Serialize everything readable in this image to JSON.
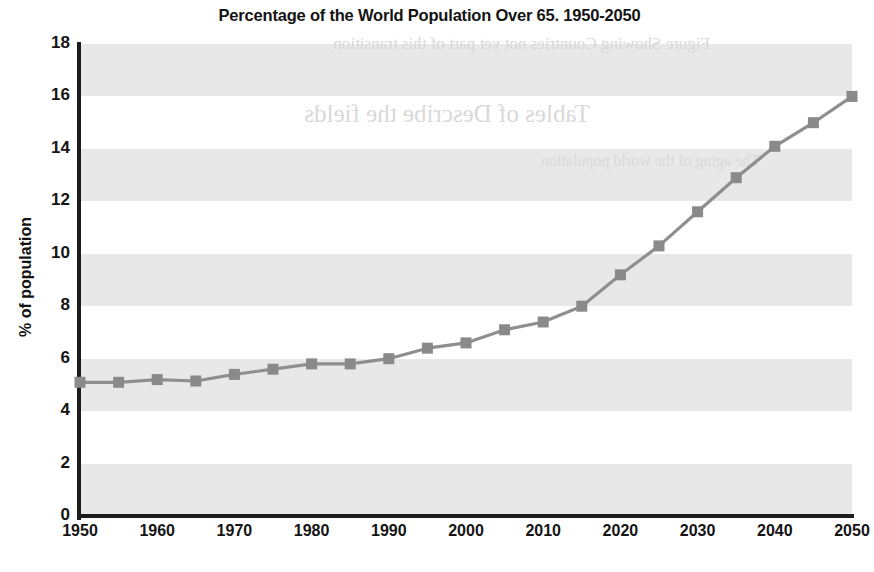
{
  "chart_data": {
    "type": "line",
    "title": "Percentage of the World Population Over 65. 1950-2050",
    "xlabel": "",
    "ylabel": "% of population",
    "xlim": [
      1950,
      2050
    ],
    "ylim": [
      0,
      18
    ],
    "ytick_step": 2,
    "xtick_step": 10,
    "grid": "horizontal-alternating-bands",
    "legend": "none",
    "marker": "square",
    "x": [
      1950,
      1955,
      1960,
      1965,
      1970,
      1975,
      1980,
      1985,
      1990,
      1995,
      2000,
      2005,
      2010,
      2015,
      2020,
      2025,
      2030,
      2035,
      2040,
      2045,
      2050
    ],
    "values": [
      5.1,
      5.1,
      5.2,
      5.15,
      5.4,
      5.6,
      5.8,
      5.8,
      6.0,
      6.4,
      6.6,
      7.1,
      7.4,
      8.0,
      9.2,
      10.3,
      11.6,
      12.9,
      14.1,
      15.0,
      16.0
    ],
    "series": [
      {
        "name": "% of world population over 65",
        "values": [
          5.1,
          5.1,
          5.2,
          5.15,
          5.4,
          5.6,
          5.8,
          5.8,
          6.0,
          6.4,
          6.6,
          7.1,
          7.4,
          8.0,
          9.2,
          10.3,
          11.6,
          12.9,
          14.1,
          15.0,
          16.0
        ]
      }
    ],
    "ytick_labels": [
      "0",
      "2",
      "4",
      "6",
      "8",
      "10",
      "12",
      "14",
      "16",
      "18"
    ],
    "ytick_values": [
      0,
      2,
      4,
      6,
      8,
      10,
      12,
      14,
      16,
      18
    ],
    "xtick_labels": [
      "1950",
      "1960",
      "1970",
      "1980",
      "1990",
      "2000",
      "2010",
      "2020",
      "2030",
      "2040",
      "2050"
    ],
    "xtick_values": [
      1950,
      1960,
      1970,
      1980,
      1990,
      2000,
      2010,
      2020,
      2030,
      2040,
      2050
    ],
    "band_ranges": [
      [
        0,
        2
      ],
      [
        4,
        6
      ],
      [
        8,
        10
      ],
      [
        12,
        14
      ],
      [
        16,
        18
      ]
    ],
    "colors": {
      "line": "#8f8f8f",
      "marker": "#8a8a8a",
      "axis": "#1c1c1c",
      "band": "#e8e8e8",
      "text": "#141414",
      "background": "#ffffff"
    }
  },
  "artifacts": {
    "note": "faint mirrored bleed-through text from reverse page",
    "lines": [
      "Figure Showing Countries not yet part of this transition",
      "Tables of Describe the fields",
      "The aging of the world population"
    ]
  }
}
